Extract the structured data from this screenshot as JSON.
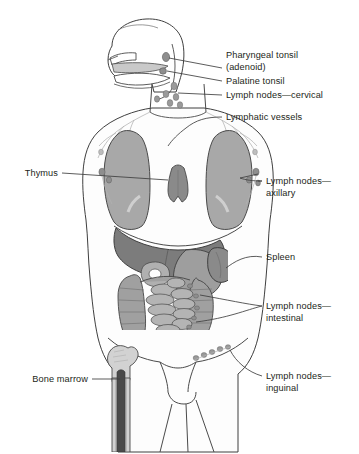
{
  "figure": {
    "type": "anatomical-diagram",
    "view": "anterior whole-body schematic with sagittal head section",
    "background_color": "#ffffff",
    "text_color": "#231f20",
    "outline_color": "#3b3b3b"
  },
  "labels": {
    "pharyngeal_tonsil": "Pharyngeal tonsil",
    "pharyngeal_tonsil_alt": "(adenoid)",
    "palatine_tonsil": "Palatine tonsil",
    "lymph_nodes_cervical": "Lymph nodes—cervical",
    "lymphatic_vessels": "Lymphatic vessels",
    "lymph_nodes_axillary_1": "Lymph nodes—",
    "lymph_nodes_axillary_2": "axillary",
    "spleen": "Spleen",
    "lymph_nodes_intestinal_1": "Lymph nodes—",
    "lymph_nodes_intestinal_2": "intestinal",
    "lymph_nodes_inguinal_1": "Lymph nodes—",
    "lymph_nodes_inguinal_2": "inguinal",
    "thymus": "Thymus",
    "bone_marrow": "Bone marrow"
  },
  "structures": [
    {
      "name": "pharyngeal-tonsil",
      "side": "midline",
      "fill": "#8e8e8e"
    },
    {
      "name": "palatine-tonsil",
      "side": "midline",
      "fill": "#8e8e8e"
    },
    {
      "name": "cervical-lymph-nodes",
      "side": "neck",
      "fill": "#9a9a9a",
      "count": 6
    },
    {
      "name": "lymphatic-vessels",
      "side": "bilateral",
      "fill": "#b9b9b9"
    },
    {
      "name": "thymus",
      "side": "midline-thorax",
      "fill": "#8a8a8a"
    },
    {
      "name": "lung-left",
      "side": "left",
      "fill": "#a8a8a8"
    },
    {
      "name": "lung-right",
      "side": "right",
      "fill": "#a8a8a8"
    },
    {
      "name": "axillary-lymph-nodes",
      "side": "bilateral",
      "fill": "#8e8e8e",
      "count": 4
    },
    {
      "name": "liver",
      "side": "right-upper-abdomen",
      "fill": "#7c7c7c"
    },
    {
      "name": "stomach",
      "side": "left-upper-abdomen",
      "fill": "#9e9e9e"
    },
    {
      "name": "spleen",
      "side": "left",
      "fill": "#8a8a8a"
    },
    {
      "name": "colon",
      "side": "frame",
      "fill": "#a0a0a0"
    },
    {
      "name": "small-intestine",
      "side": "central",
      "fill": "#b4b4b4"
    },
    {
      "name": "intestinal-lymph-nodes",
      "side": "mesentery",
      "fill": "#8e8e8e"
    },
    {
      "name": "inguinal-lymph-nodes",
      "side": "right-groin",
      "fill": "#9a9a9a",
      "count": 5
    },
    {
      "name": "femur",
      "side": "left",
      "fill": "#d2d2d2"
    },
    {
      "name": "bone-marrow",
      "side": "left-femur-shaft",
      "fill": "#4a4a4a"
    }
  ],
  "label_positions": {
    "pharyngeal_tonsil": {
      "x": 226,
      "y": 50
    },
    "palatine_tonsil": {
      "x": 226,
      "y": 83
    },
    "lymph_nodes_cervical": {
      "x": 226,
      "y": 97
    },
    "lymphatic_vessels": {
      "x": 226,
      "y": 113
    },
    "lymph_nodes_axillary": {
      "x": 266,
      "y": 178
    },
    "spleen": {
      "x": 266,
      "y": 253
    },
    "lymph_nodes_intestinal": {
      "x": 266,
      "y": 303
    },
    "lymph_nodes_inguinal": {
      "x": 266,
      "y": 373
    },
    "thymus": {
      "x": 14,
      "y": 170
    },
    "bone_marrow": {
      "x": 18,
      "y": 375
    }
  }
}
